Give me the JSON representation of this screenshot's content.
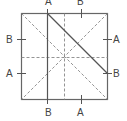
{
  "diagram": {
    "square": {
      "x": 21,
      "y": 13,
      "size": 86
    },
    "colors": {
      "line": "#555555",
      "dashed": "#888888",
      "text": "#444444"
    },
    "labels": {
      "top_left": "A",
      "top_right": "B",
      "left_upper": "B",
      "left_lower": "A",
      "right_upper": "A",
      "right_lower": "B",
      "bottom_left": "B",
      "bottom_right": "A"
    }
  }
}
